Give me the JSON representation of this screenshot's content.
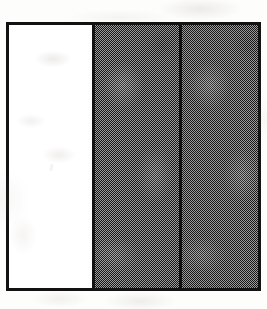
{
  "figure": {
    "kind": "scanned-diagram",
    "frame": {
      "border_color": "#121212",
      "border_thickness_px": 3,
      "background_color": "#ffffff",
      "x_px": 6,
      "y_px": 22,
      "width_px": 255,
      "height_px": 269
    },
    "page_background_color": "#fdfdfc",
    "panel_count": 3,
    "divider_count": 2,
    "divider": {
      "color": "#121212",
      "thickness_px": 3,
      "orientation": "vertical"
    },
    "panels": [
      {
        "id": "left",
        "fill": "white",
        "fill_color": "#ffffff",
        "shaded": "no",
        "label": "",
        "width_percent": 33.2
      },
      {
        "id": "middle",
        "fill": "grey-halftone",
        "fill_color": "#6e6e6e",
        "shaded": "yes",
        "label": "",
        "width_percent": 33.9
      },
      {
        "id": "right",
        "fill": "grey-halftone",
        "fill_color": "#6e6e6e",
        "shaded": "yes",
        "label": "",
        "width_percent": 32.9
      }
    ],
    "texture": {
      "type": "checkerboard-dither",
      "cell_size_px": 1,
      "dark_color": "#161616",
      "light_color": "#9c9c9c",
      "effective_tone": "#6e6e6e"
    },
    "artifacts": {
      "margin_ghosting": "present",
      "speck_in_middle_panel": "present"
    }
  }
}
